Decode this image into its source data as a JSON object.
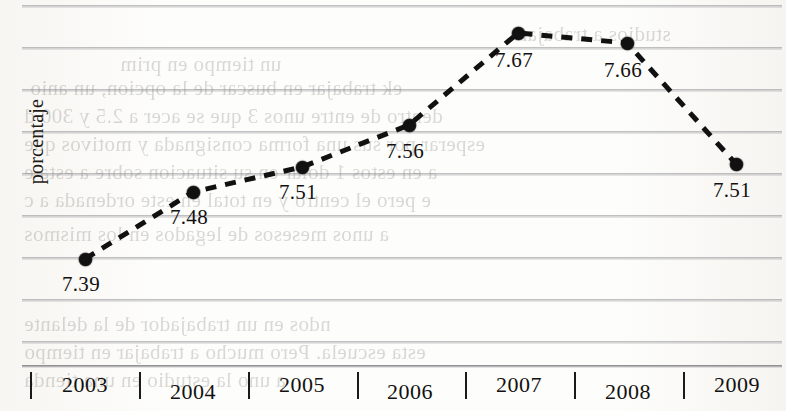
{
  "chart_data": {
    "type": "line",
    "title": "",
    "xlabel": "",
    "ylabel": "porcentaje",
    "categories": [
      "2003",
      "2004",
      "2005",
      "2006",
      "2007",
      "2008",
      "2009"
    ],
    "values": [
      7.39,
      7.48,
      7.51,
      7.56,
      7.67,
      7.66,
      7.51
    ],
    "point_labels": [
      "7.39",
      "7.48",
      "7.51",
      "7.56",
      "7.67",
      "7.66",
      "7.51"
    ],
    "series": [
      {
        "name": "porcentaje",
        "values": [
          7.39,
          7.48,
          7.51,
          7.56,
          7.67,
          7.66,
          7.51
        ],
        "line_style": "dashed",
        "marker": "filled-circle",
        "color": "#111111"
      }
    ],
    "ylim": [
      7.35,
      7.7
    ],
    "grid": true,
    "grid_orientation": "horizontal",
    "legend": "none",
    "legend_position": "none",
    "marker_color": "#111111",
    "line_color": "#111111"
  },
  "axis": {
    "y_title": "porcentaje",
    "x_ticks": [
      "2003",
      "2004",
      "2005",
      "2006",
      "2007",
      "2008",
      "2009"
    ]
  },
  "points": [
    {
      "year": "2003",
      "label": "7.39",
      "x": 85,
      "y": 259,
      "lx": 62,
      "ly": 272
    },
    {
      "year": "2004",
      "label": "7.48",
      "x": 193,
      "y": 192,
      "lx": 170,
      "ly": 205
    },
    {
      "year": "2005",
      "label": "7.51",
      "x": 302,
      "y": 167,
      "lx": 279,
      "ly": 180
    },
    {
      "year": "2006",
      "label": "7.56",
      "x": 409,
      "y": 125,
      "lx": 386,
      "ly": 139
    },
    {
      "year": "2007",
      "label": "7.67",
      "x": 518,
      "y": 33,
      "lx": 495,
      "ly": 48
    },
    {
      "year": "2008",
      "label": "7.66",
      "x": 627,
      "y": 43,
      "lx": 604,
      "ly": 58
    },
    {
      "year": "2009",
      "label": "7.51",
      "x": 736,
      "y": 164,
      "lx": 713,
      "ly": 178
    }
  ],
  "gridlines_y": [
    5,
    47,
    89,
    131,
    173,
    215,
    257,
    299,
    341,
    365
  ],
  "x_ticks_pos": [
    30,
    139,
    248,
    357,
    465,
    574,
    683
  ],
  "x_labels_pos": [
    85,
    193,
    302,
    410,
    519,
    628,
    737
  ],
  "showthrough": [
    {
      "text": "studios a trabajar",
      "x": 520,
      "y": 22
    },
    {
      "text": "un tiempo en prim",
      "x": 120,
      "y": 52
    },
    {
      "text": "ek trabajar en buscar de la opcion, un anio",
      "x": 30,
      "y": 76
    },
    {
      "text": "dentro de entre unos 3 que se acer a 2.5 y 300 d",
      "x": 24,
      "y": 104
    },
    {
      "text": "esperar por sus una forma consignada y motivos que",
      "x": 24,
      "y": 132
    },
    {
      "text": "a en estos 1 dolar en su situacion sobre a esta e",
      "x": 24,
      "y": 160
    },
    {
      "text": "e pero el centro y en total en este ordenada a c",
      "x": 24,
      "y": 188
    },
    {
      "text": "a unos mesesos de legados en los mismos",
      "x": 24,
      "y": 222
    },
    {
      "text": "ndos en un trabajador de la delante",
      "x": 24,
      "y": 312
    },
    {
      "text": "esta escuela. Pero mucho a trabajar en tiempo",
      "x": 24,
      "y": 340
    },
    {
      "text": "a uno la estudio en una tienda",
      "x": 24,
      "y": 368
    }
  ]
}
